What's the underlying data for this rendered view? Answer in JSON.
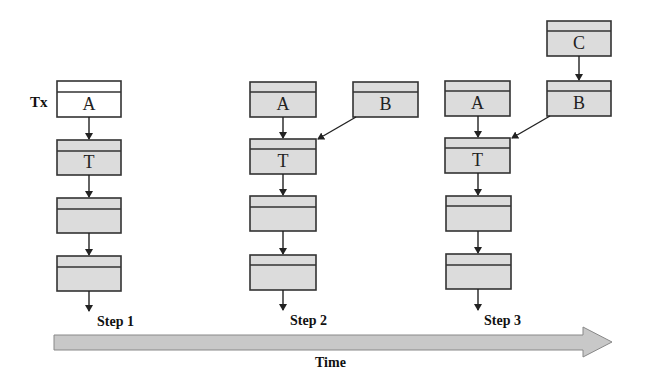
{
  "figure": {
    "tx_label": "Tx",
    "axis_label": "Time",
    "colors": {
      "box_fill": "#dcdcdc",
      "box_fill_first": "#ffffff",
      "stroke": "#333333",
      "arrow_fill": "#c8c8c8"
    },
    "steps": [
      {
        "label": "Step 1",
        "chain": [
          "A",
          "T",
          "",
          ""
        ],
        "side_blocks": []
      },
      {
        "label": "Step 2",
        "chain": [
          "A",
          "T",
          "",
          ""
        ],
        "side_blocks": [
          "B"
        ]
      },
      {
        "label": "Step 3",
        "chain": [
          "A",
          "T",
          "",
          ""
        ],
        "side_blocks": [
          "B",
          "C"
        ]
      }
    ]
  }
}
